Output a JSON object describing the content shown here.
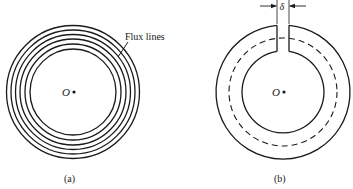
{
  "figure_a": {
    "caption": "(a)",
    "center_label": "O",
    "annotation": "Flux lines",
    "ring_count": 6
  },
  "figure_b": {
    "caption": "(b)",
    "center_label": "O",
    "gap_label": "δ"
  },
  "colors": {
    "stroke": "#1a1a1a",
    "background": "#ffffff"
  }
}
